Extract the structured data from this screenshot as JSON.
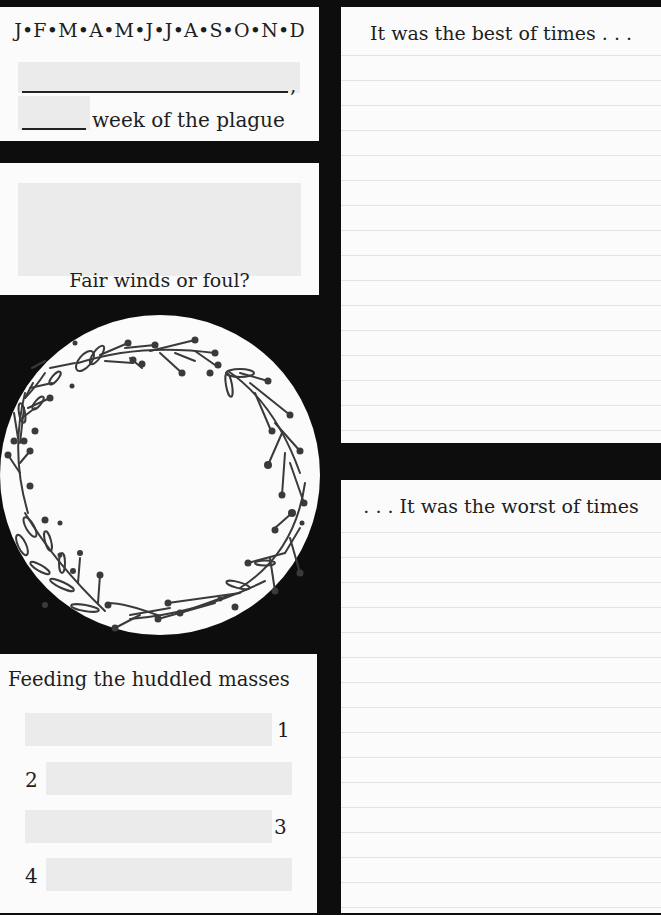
{
  "date_panel": {
    "months": "J•F•M•A•M•J•J•A•S•O•N•D",
    "date_field_value": "",
    "comma": ",",
    "week_field_value": "",
    "week_suffix": "week of the plague"
  },
  "weather_panel": {
    "field_value": "",
    "label": "Fair winds or foul?"
  },
  "wreath": {
    "icon": "floral-wreath-icon",
    "content": ""
  },
  "meals_panel": {
    "title": "Feeding the huddled masses",
    "items": [
      {
        "number": "1",
        "value": ""
      },
      {
        "number": "2",
        "value": ""
      },
      {
        "number": "3",
        "value": ""
      },
      {
        "number": "4",
        "value": ""
      }
    ]
  },
  "best_panel": {
    "heading": "It was the best of times . . .",
    "content": ""
  },
  "worst_panel": {
    "heading": ". . . It was the worst of times",
    "content": ""
  },
  "colors": {
    "background": "#0d0d0d",
    "panel": "#fbfbfb",
    "field": "#ebebeb",
    "ink": "#1e1e1e",
    "rule": "#e3e3e3"
  }
}
